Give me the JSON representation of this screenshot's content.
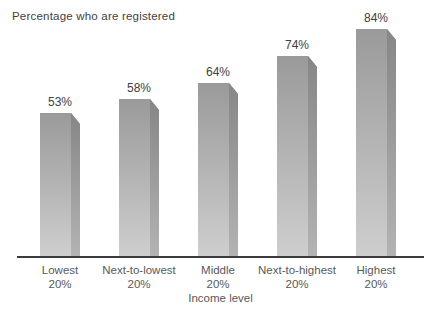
{
  "chart_data": {
    "type": "bar",
    "title": "Percentage who are registered",
    "xlabel": "Income level",
    "ylabel": "",
    "categories": [
      "Lowest",
      "Next-to-lowest",
      "Middle",
      "Next-to-highest",
      "Highest"
    ],
    "category_suffix": "20%",
    "values": [
      53,
      58,
      64,
      74,
      84
    ],
    "value_labels": [
      "53%",
      "58%",
      "64%",
      "74%",
      "84%"
    ],
    "ylim": [
      0,
      95
    ],
    "grid": false,
    "legend": "none",
    "colors": {
      "background": "#ffffff",
      "bar_face_top": "#9a9a9a",
      "bar_face_bottom": "#cecece",
      "bar_side_top": "#868686",
      "bar_side_bottom": "#b3b3b3",
      "axis_line": "#3b3b3b",
      "title_text": "#414042",
      "value_text": "#414042",
      "category_text": "#58595b"
    }
  }
}
